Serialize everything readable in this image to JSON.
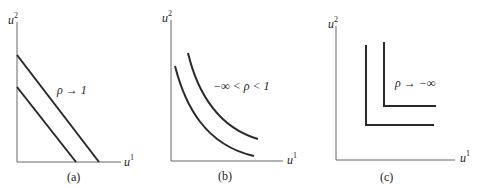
{
  "figure": {
    "panels": [
      {
        "id": "a",
        "caption": "(a)",
        "annotation": "ρ → 1",
        "y_axis_label": "u",
        "y_axis_sup": "2",
        "x_axis_label": "u",
        "x_axis_sup": "1",
        "curve_type": "parallel straight lines (perfect substitutes)"
      },
      {
        "id": "b",
        "caption": "(b)",
        "annotation": "−∞ < ρ < 1",
        "y_axis_label": "u",
        "y_axis_sup": "2",
        "x_axis_label": "u",
        "x_axis_sup": "1",
        "curve_type": "convex curves"
      },
      {
        "id": "c",
        "caption": "(c)",
        "annotation": "ρ → −∞",
        "y_axis_label": "u",
        "y_axis_sup": "2",
        "x_axis_label": "u",
        "x_axis_sup": "1",
        "curve_type": "L-shaped (perfect complements)"
      }
    ],
    "colors": {
      "axis": "#555555",
      "curve": "#2a2a2a",
      "text": "#222222"
    }
  }
}
